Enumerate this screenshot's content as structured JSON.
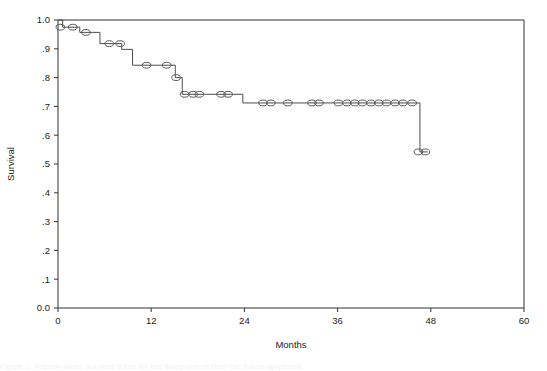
{
  "figure": {
    "background_color": "#ffffff",
    "line_color": "#4d4d4d",
    "marker_stroke_color": "#595959",
    "axis_color": "#333333",
    "caption_partial": "Figure 2.  Kaplan-Meier survival curve for the study cohort over the follow-up period."
  },
  "chart_data": {
    "type": "line",
    "subtype": "kaplan-meier-step",
    "title": "",
    "subtitle": "",
    "xlabel": "Months",
    "ylabel": "Survival",
    "xlim": [
      0,
      60
    ],
    "ylim": [
      0.0,
      1.0
    ],
    "grid": false,
    "legend": null,
    "legend_position": "none",
    "xticks": [
      0,
      12,
      24,
      36,
      48,
      60
    ],
    "xtick_labels": [
      "0",
      "12",
      "24",
      "36",
      "48",
      "60"
    ],
    "yticks": [
      0.0,
      0.1,
      0.2,
      0.3,
      0.4,
      0.5,
      0.6,
      0.7,
      0.8,
      0.9,
      1.0
    ],
    "ytick_labels": [
      "0.0",
      ".1",
      ".2",
      ".3",
      ".4",
      ".5",
      ".6",
      ".7",
      ".8",
      ".9",
      "1.0"
    ],
    "series": [
      {
        "name": "Survival",
        "step_points": [
          {
            "x": 0.0,
            "y": 1.0
          },
          {
            "x": 0.6,
            "y": 1.0
          },
          {
            "x": 0.6,
            "y": 0.975
          },
          {
            "x": 2.8,
            "y": 0.975
          },
          {
            "x": 2.8,
            "y": 0.957
          },
          {
            "x": 5.4,
            "y": 0.957
          },
          {
            "x": 5.4,
            "y": 0.918
          },
          {
            "x": 8.2,
            "y": 0.918
          },
          {
            "x": 8.2,
            "y": 0.898
          },
          {
            "x": 9.6,
            "y": 0.898
          },
          {
            "x": 9.6,
            "y": 0.843
          },
          {
            "x": 15.1,
            "y": 0.843
          },
          {
            "x": 15.1,
            "y": 0.8
          },
          {
            "x": 16.0,
            "y": 0.8
          },
          {
            "x": 16.0,
            "y": 0.742
          },
          {
            "x": 23.8,
            "y": 0.742
          },
          {
            "x": 23.8,
            "y": 0.712
          },
          {
            "x": 46.6,
            "y": 0.712
          },
          {
            "x": 46.6,
            "y": 0.542
          },
          {
            "x": 47.6,
            "y": 0.542
          }
        ],
        "censored_points": [
          {
            "x": 0.3,
            "y": 0.975
          },
          {
            "x": 1.9,
            "y": 0.975
          },
          {
            "x": 3.6,
            "y": 0.957
          },
          {
            "x": 6.6,
            "y": 0.918
          },
          {
            "x": 8.0,
            "y": 0.918
          },
          {
            "x": 11.4,
            "y": 0.843
          },
          {
            "x": 14.0,
            "y": 0.843
          },
          {
            "x": 15.2,
            "y": 0.8
          },
          {
            "x": 16.3,
            "y": 0.742
          },
          {
            "x": 17.4,
            "y": 0.742
          },
          {
            "x": 18.2,
            "y": 0.742
          },
          {
            "x": 21.0,
            "y": 0.742
          },
          {
            "x": 21.9,
            "y": 0.742
          },
          {
            "x": 26.4,
            "y": 0.712
          },
          {
            "x": 27.4,
            "y": 0.712
          },
          {
            "x": 29.6,
            "y": 0.712
          },
          {
            "x": 32.7,
            "y": 0.712
          },
          {
            "x": 33.6,
            "y": 0.712
          },
          {
            "x": 36.1,
            "y": 0.712
          },
          {
            "x": 37.2,
            "y": 0.712
          },
          {
            "x": 38.2,
            "y": 0.712
          },
          {
            "x": 39.2,
            "y": 0.712
          },
          {
            "x": 40.3,
            "y": 0.712
          },
          {
            "x": 41.3,
            "y": 0.712
          },
          {
            "x": 42.3,
            "y": 0.712
          },
          {
            "x": 43.4,
            "y": 0.712
          },
          {
            "x": 44.4,
            "y": 0.712
          },
          {
            "x": 45.6,
            "y": 0.712
          },
          {
            "x": 46.4,
            "y": 0.542
          },
          {
            "x": 47.3,
            "y": 0.542
          }
        ]
      }
    ]
  }
}
